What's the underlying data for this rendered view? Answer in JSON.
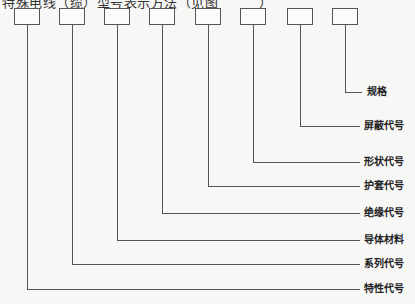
{
  "caption": "特殊电线（缆）型号表示方法（见图　　　）",
  "boxes": [
    {
      "x": 14,
      "label": "特性代号",
      "line_y": 289
    },
    {
      "x": 59,
      "label": "系列代号",
      "line_y": 264
    },
    {
      "x": 104,
      "label": "导体材料",
      "line_y": 240
    },
    {
      "x": 149,
      "label": "绝缘代号",
      "line_y": 213
    },
    {
      "x": 195,
      "label": "护套代号",
      "line_y": 186
    },
    {
      "x": 240,
      "label": "形状代号",
      "line_y": 162
    },
    {
      "x": 287,
      "label": "屏蔽代号",
      "line_y": 126
    },
    {
      "x": 332,
      "label": "规格",
      "line_y": 92
    }
  ],
  "labels": {
    "spec": "规格",
    "shield": "屏蔽代号",
    "shape": "形状代号",
    "sheath": "护套代号",
    "insulation": "绝缘代号",
    "conductor": "导体材料",
    "series": "系列代号",
    "characteristic": "特性代号"
  }
}
